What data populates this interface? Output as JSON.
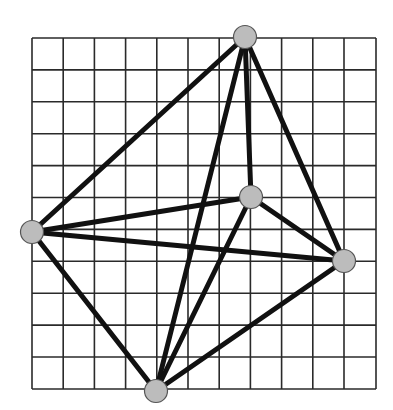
{
  "diagram": {
    "type": "graph",
    "grid": {
      "x_lines": [
        32,
        63.2,
        94.4,
        125.6,
        156.8,
        188,
        219.2,
        250.4,
        281.6,
        312.8,
        344,
        376
      ],
      "y_lines": [
        38,
        69.9,
        101.8,
        133.7,
        165.6,
        197.5,
        229.4,
        261.3,
        293.2,
        325.1,
        357,
        389
      ],
      "columns": 11,
      "rows": 11,
      "line_color": "#2a2a2a"
    },
    "nodes": [
      {
        "id": "top",
        "x": 245,
        "y": 37
      },
      {
        "id": "left",
        "x": 32,
        "y": 232
      },
      {
        "id": "center",
        "x": 251,
        "y": 197
      },
      {
        "id": "right",
        "x": 344,
        "y": 261
      },
      {
        "id": "bottom",
        "x": 156,
        "y": 391
      }
    ],
    "edges": [
      [
        "top",
        "left"
      ],
      [
        "top",
        "center"
      ],
      [
        "top",
        "right"
      ],
      [
        "top",
        "bottom"
      ],
      [
        "left",
        "center"
      ],
      [
        "left",
        "right"
      ],
      [
        "left",
        "bottom"
      ],
      [
        "center",
        "right"
      ],
      [
        "center",
        "bottom"
      ],
      [
        "right",
        "bottom"
      ]
    ],
    "style": {
      "node_radius": 11.5,
      "node_fill": "#bcbcbc",
      "node_stroke": "#555555",
      "edge_color": "#111111",
      "edge_width": 5
    }
  }
}
